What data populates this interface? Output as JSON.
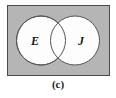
{
  "figure": {
    "caption": "(c)",
    "type": "venn-diagram",
    "universal_set": {
      "shape": "rectangle",
      "fill_color": "#b5b5b5",
      "stroke_color": "#4a4a4a"
    },
    "sets": [
      {
        "label": "E",
        "position": "left",
        "fill_color": "#fdfdfd",
        "stroke_color": "#555555"
      },
      {
        "label": "J",
        "position": "right",
        "fill_color": "#fdfdfd",
        "stroke_color": "#555555"
      }
    ],
    "intersection": {
      "shaded": false,
      "fill_color": "#fdfdfd"
    }
  }
}
